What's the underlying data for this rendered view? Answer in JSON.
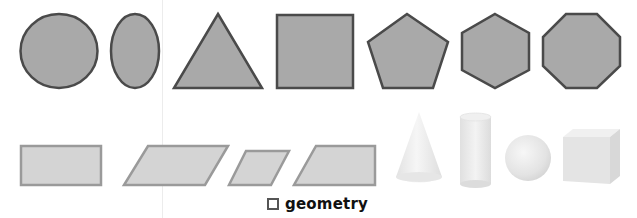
{
  "caption": {
    "label": "geometry",
    "icon": "square-outline-icon"
  },
  "colors": {
    "flat_fill_dark": "#a9a9a9",
    "flat_stroke_dark": "#4a4a4a",
    "flat_fill_light": "#d4d4d4",
    "flat_stroke_light": "#9a9a9a",
    "solid_fill": "#ebebeb",
    "divider": "#ececec"
  },
  "shapes": {
    "plane_row": [
      "circle",
      "ellipse",
      "triangle",
      "square",
      "pentagon",
      "hexagon",
      "octagon"
    ],
    "quad_row": [
      "rectangle",
      "parallelogram",
      "rhombus",
      "trapezoid"
    ],
    "solid_row": [
      "cone",
      "cylinder",
      "sphere",
      "cube"
    ]
  }
}
